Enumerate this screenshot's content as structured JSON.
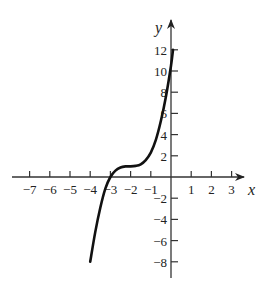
{
  "chart_data": {
    "type": "line",
    "title": "",
    "xlabel": "x",
    "ylabel": "y",
    "xlim": [
      -7.5,
      4
    ],
    "ylim": [
      -9,
      13
    ],
    "grid": false,
    "x_ticks": [
      -7,
      -6,
      -5,
      -4,
      -3,
      -2,
      -1,
      1,
      2,
      3
    ],
    "x_tick_labels": [
      "−7",
      "−6",
      "−5",
      "−4",
      "−3",
      "−2",
      "−1",
      "1",
      "2",
      "3"
    ],
    "y_ticks": [
      -8,
      -6,
      -4,
      -2,
      2,
      4,
      6,
      8,
      10,
      12
    ],
    "y_tick_labels": [
      "−8",
      "−6",
      "−4",
      "−2",
      "2",
      "4",
      "6",
      "8",
      "10",
      "12"
    ],
    "series": [
      {
        "name": "curve",
        "color": "#111111",
        "x": [
          -4.0,
          -3.75,
          -3.5,
          -3.25,
          -3.0,
          -2.75,
          -2.5,
          -2.25,
          -2.0,
          -1.75,
          -1.5,
          -1.25,
          -1.0,
          -0.75,
          -0.5,
          -0.25,
          0.0,
          0.1
        ],
        "y": [
          -8.0,
          -5.2,
          -2.9,
          -1.1,
          0.0,
          0.6,
          0.9,
          1.0,
          1.0,
          1.05,
          1.2,
          1.6,
          2.3,
          3.5,
          5.3,
          7.6,
          10.5,
          12.0
        ]
      }
    ]
  },
  "labels": {
    "x_axis": "x",
    "y_axis": "y"
  }
}
